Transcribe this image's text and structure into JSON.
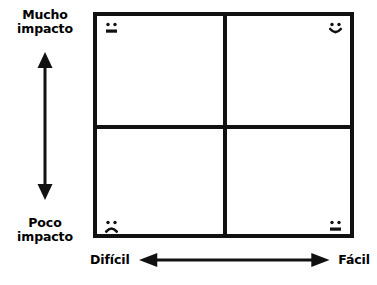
{
  "diagram": {
    "type": "2x2-impact-effort-matrix",
    "background_color": "#ffffff",
    "line_color": "#111111"
  },
  "y_axis": {
    "top_label": "Mucho\nimpacto",
    "bottom_label": "Poco\nimpacto",
    "arrow": "double-headed-vertical-arrow"
  },
  "x_axis": {
    "left_label": "Difícil",
    "right_label": "Fácil",
    "arrow": "double-headed-horizontal-arrow"
  },
  "quadrants": [
    {
      "id": "top-left",
      "impact": "Mucho impacto",
      "effort": "Difícil",
      "face": "neutral-face"
    },
    {
      "id": "top-right",
      "impact": "Mucho impacto",
      "effort": "Fácil",
      "face": "happy-face"
    },
    {
      "id": "bottom-left",
      "impact": "Poco impacto",
      "effort": "Difícil",
      "face": "sad-face"
    },
    {
      "id": "bottom-right",
      "impact": "Poco impacto",
      "effort": "Fácil",
      "face": "neutral-face"
    }
  ]
}
